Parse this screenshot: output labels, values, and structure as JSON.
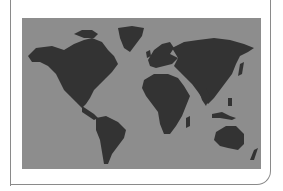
{
  "map": {
    "type": "world-map",
    "projection": "equirectangular",
    "colors": {
      "ocean": "#8d8d8d",
      "land": "#333333",
      "frame": "#8a8a8a",
      "background": "#ffffff"
    },
    "regions": [
      "North America",
      "Greenland",
      "South America",
      "Europe",
      "Africa",
      "Asia",
      "Australia",
      "New Zealand",
      "Madagascar",
      "Japan",
      "Indonesia"
    ]
  }
}
